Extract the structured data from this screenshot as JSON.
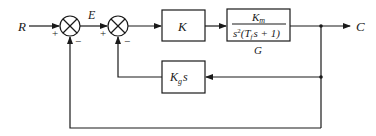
{
  "diagram": {
    "type": "block-diagram",
    "input_label": "R",
    "output_label": "C",
    "error_label": "E",
    "summing_junctions": [
      {
        "id": "sum1",
        "plus_sign": "+",
        "minus_sign": "−"
      },
      {
        "id": "sum2",
        "plus_sign": "+",
        "minus_sign": "−"
      }
    ],
    "blocks": {
      "controller": {
        "label": "K"
      },
      "plant": {
        "numerator": "K",
        "numerator_sub": "m",
        "denominator_s": "s",
        "denominator_exp": "2",
        "denominator_open": "(T",
        "denominator_sub": "f",
        "denominator_rest": "s + 1)",
        "caption": "G"
      },
      "tachometer_feedback": {
        "label": "K",
        "label_sub": "g",
        "label_suffix": "s"
      }
    },
    "connections": [
      "R -> sum1(+)",
      "sum1 -> E -> sum2(+)",
      "sum2 -> K",
      "K -> G",
      "G -> C",
      "C -> Kg s -> sum2(-)",
      "C -> sum1(-)"
    ]
  }
}
